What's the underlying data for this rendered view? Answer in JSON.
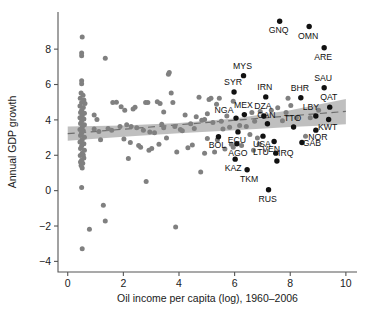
{
  "chart_data": {
    "type": "scatter",
    "title": "",
    "xlabel": "Oil income per capita (log), 1960–2006",
    "ylabel": "Annual GDP growth",
    "xlim": [
      -0.35,
      10.4
    ],
    "ylim": [
      -4.6,
      10.1
    ],
    "xticks": [
      0,
      2,
      4,
      6,
      8,
      10
    ],
    "xticklabels": [
      "0",
      "2",
      "4",
      "6",
      "8",
      "10"
    ],
    "yticks": [
      -4,
      -2,
      0,
      2,
      4,
      6,
      8
    ],
    "yticklabels": [
      "−4",
      "−2",
      "0",
      "2",
      "4",
      "6",
      "8"
    ],
    "grid": false,
    "legend": null,
    "colors": {
      "unlabeled_point": "#808080",
      "labeled_point": "#111111",
      "confidence_band": "#b4b4b4",
      "fit_line": "#6e6e6e",
      "axis": "#555555"
    },
    "fit_line": {
      "style": "dashed",
      "x_start": 0.0,
      "y_start": 3.22,
      "x_end": 10.0,
      "y_end": 4.48
    },
    "confidence_band": {
      "x": [
        0.0,
        2.0,
        4.0,
        6.0,
        8.0,
        9.2,
        10.0
      ],
      "upper": [
        3.62,
        3.68,
        3.83,
        4.08,
        4.55,
        4.92,
        5.18
      ],
      "lower": [
        2.82,
        3.04,
        3.25,
        3.42,
        3.6,
        3.68,
        3.76
      ]
    },
    "labeled_points": [
      {
        "label": "GNQ",
        "x": 7.62,
        "y": 9.58,
        "label_dx": -1,
        "label_dy": 12
      },
      {
        "label": "OMN",
        "x": 8.68,
        "y": 9.28,
        "label_dx": -1,
        "label_dy": 12
      },
      {
        "label": "ARE",
        "x": 9.22,
        "y": 8.08,
        "label_dx": -1,
        "label_dy": 12
      },
      {
        "label": "MYS",
        "x": 6.32,
        "y": 6.5,
        "label_dx": -1,
        "label_dy": -7
      },
      {
        "label": "SAU",
        "x": 9.22,
        "y": 5.82,
        "label_dx": -1,
        "label_dy": -7
      },
      {
        "label": "SYR",
        "x": 5.98,
        "y": 5.58,
        "label_dx": -1,
        "label_dy": -7
      },
      {
        "label": "IRN",
        "x": 7.12,
        "y": 5.3,
        "label_dx": -1,
        "label_dy": -7
      },
      {
        "label": "BHR",
        "x": 8.38,
        "y": 5.25,
        "label_dx": -1,
        "label_dy": -7
      },
      {
        "label": "QAT",
        "x": 9.42,
        "y": 4.72,
        "label_dx": -1,
        "label_dy": -7
      },
      {
        "label": "MEX",
        "x": 6.35,
        "y": 4.3,
        "label_dx": -1,
        "label_dy": -7
      },
      {
        "label": "NGA",
        "x": 6.05,
        "y": 4.1,
        "label_dx": -12,
        "label_dy": -5
      },
      {
        "label": "DZA",
        "x": 7.05,
        "y": 4.22,
        "label_dx": -1,
        "label_dy": -7
      },
      {
        "label": "LBY",
        "x": 8.92,
        "y": 4.22,
        "label_dx": -5,
        "label_dy": -6
      },
      {
        "label": "CAN",
        "x": 7.18,
        "y": 3.78,
        "label_dx": -1,
        "label_dy": -6
      },
      {
        "label": "KWT",
        "x": 9.38,
        "y": 4.02,
        "label_dx": -1,
        "label_dy": 10
      },
      {
        "label": "TTO",
        "x": 8.12,
        "y": 3.6,
        "label_dx": -1,
        "label_dy": -6
      },
      {
        "label": "NOR",
        "x": 8.92,
        "y": 3.42,
        "label_dx": 2,
        "label_dy": 10
      },
      {
        "label": "ECU",
        "x": 6.12,
        "y": 3.32,
        "label_dx": -1,
        "label_dy": 11
      },
      {
        "label": "USA",
        "x": 7.02,
        "y": 3.08,
        "label_dx": -1,
        "label_dy": 11
      },
      {
        "label": "BOL",
        "x": 5.42,
        "y": 3.05,
        "label_dx": -1,
        "label_dy": 11
      },
      {
        "label": "VEN",
        "x": 7.42,
        "y": 2.78,
        "label_dx": -3,
        "label_dy": 11
      },
      {
        "label": "GAB",
        "x": 8.42,
        "y": 2.72,
        "label_dx": 10,
        "label_dy": 3
      },
      {
        "label": "AGO",
        "x": 6.08,
        "y": 2.65,
        "label_dx": 1,
        "label_dy": 12
      },
      {
        "label": "IRQ",
        "x": 7.48,
        "y": 2.12,
        "label_dx": 10,
        "label_dy": 3
      },
      {
        "label": "KAZ",
        "x": 6.02,
        "y": 1.78,
        "label_dx": -2,
        "label_dy": 12
      },
      {
        "label": "TKM",
        "x": 6.45,
        "y": 1.18,
        "label_dx": 2,
        "label_dy": 12
      },
      {
        "label": "LTU",
        "x": 7.52,
        "y": 1.68,
        "label_dx": -16,
        "label_dy": -6
      },
      {
        "label": "RUS",
        "x": 7.22,
        "y": 0.05,
        "label_dx": -1,
        "label_dy": 12
      }
    ],
    "unlabeled_points": [
      {
        "x": 0.52,
        "y": 8.68
      },
      {
        "x": 0.5,
        "y": 7.78
      },
      {
        "x": 0.5,
        "y": 7.62
      },
      {
        "x": 1.35,
        "y": 7.48
      },
      {
        "x": 0.5,
        "y": 6.22
      },
      {
        "x": 0.48,
        "y": 5.52
      },
      {
        "x": 0.55,
        "y": 5.4
      },
      {
        "x": 0.45,
        "y": 5.22
      },
      {
        "x": 0.58,
        "y": 5.12
      },
      {
        "x": 0.5,
        "y": 4.98
      },
      {
        "x": 0.62,
        "y": 4.92
      },
      {
        "x": 0.44,
        "y": 4.78
      },
      {
        "x": 0.56,
        "y": 4.7
      },
      {
        "x": 0.5,
        "y": 4.55
      },
      {
        "x": 0.46,
        "y": 4.42
      },
      {
        "x": 0.6,
        "y": 4.38
      },
      {
        "x": 0.52,
        "y": 4.25
      },
      {
        "x": 0.44,
        "y": 4.12
      },
      {
        "x": 0.58,
        "y": 4.05
      },
      {
        "x": 0.5,
        "y": 3.92
      },
      {
        "x": 0.46,
        "y": 3.8
      },
      {
        "x": 0.6,
        "y": 3.72
      },
      {
        "x": 0.52,
        "y": 3.58
      },
      {
        "x": 0.44,
        "y": 3.45
      },
      {
        "x": 0.56,
        "y": 3.38
      },
      {
        "x": 0.5,
        "y": 3.25
      },
      {
        "x": 0.46,
        "y": 3.12
      },
      {
        "x": 0.6,
        "y": 3.02
      },
      {
        "x": 0.52,
        "y": 2.88
      },
      {
        "x": 0.44,
        "y": 2.75
      },
      {
        "x": 0.58,
        "y": 2.65
      },
      {
        "x": 0.5,
        "y": 2.52
      },
      {
        "x": 0.46,
        "y": 2.38
      },
      {
        "x": 0.6,
        "y": 2.28
      },
      {
        "x": 0.52,
        "y": 2.12
      },
      {
        "x": 0.45,
        "y": 1.98
      },
      {
        "x": 0.58,
        "y": 1.85
      },
      {
        "x": 0.5,
        "y": 1.72
      },
      {
        "x": 0.54,
        "y": 1.55
      },
      {
        "x": 0.48,
        "y": 1.42
      },
      {
        "x": 0.52,
        "y": 1.28
      },
      {
        "x": 0.5,
        "y": 0.18
      },
      {
        "x": 0.78,
        "y": -2.18
      },
      {
        "x": 0.52,
        "y": -3.28
      },
      {
        "x": 1.28,
        "y": -0.82
      },
      {
        "x": 1.35,
        "y": -1.72
      },
      {
        "x": 3.88,
        "y": -2.05
      },
      {
        "x": 2.82,
        "y": 0.52
      },
      {
        "x": 4.78,
        "y": 1.05
      },
      {
        "x": 1.62,
        "y": 4.98
      },
      {
        "x": 0.95,
        "y": 4.28
      },
      {
        "x": 1.05,
        "y": 4.02
      },
      {
        "x": 1.18,
        "y": 2.88
      },
      {
        "x": 1.75,
        "y": 5.0
      },
      {
        "x": 2.05,
        "y": 4.55
      },
      {
        "x": 2.12,
        "y": 3.72
      },
      {
        "x": 2.28,
        "y": 3.62
      },
      {
        "x": 2.35,
        "y": 4.62
      },
      {
        "x": 2.42,
        "y": 4.72
      },
      {
        "x": 2.48,
        "y": 3.55
      },
      {
        "x": 2.55,
        "y": 2.55
      },
      {
        "x": 2.62,
        "y": 2.45
      },
      {
        "x": 2.72,
        "y": 3.42
      },
      {
        "x": 2.8,
        "y": 4.98
      },
      {
        "x": 2.88,
        "y": 4.98
      },
      {
        "x": 2.95,
        "y": 3.32
      },
      {
        "x": 3.02,
        "y": 2.38
      },
      {
        "x": 3.12,
        "y": 3.28
      },
      {
        "x": 3.22,
        "y": 5.02
      },
      {
        "x": 3.32,
        "y": 4.92
      },
      {
        "x": 3.38,
        "y": 3.75
      },
      {
        "x": 3.45,
        "y": 3.55
      },
      {
        "x": 3.55,
        "y": 2.98
      },
      {
        "x": 3.62,
        "y": 6.58
      },
      {
        "x": 3.65,
        "y": 6.68
      },
      {
        "x": 3.72,
        "y": 5.52
      },
      {
        "x": 3.78,
        "y": 4.98
      },
      {
        "x": 3.85,
        "y": 3.62
      },
      {
        "x": 3.92,
        "y": 2.18
      },
      {
        "x": 4.05,
        "y": 3.45
      },
      {
        "x": 4.12,
        "y": 3.38
      },
      {
        "x": 4.22,
        "y": 4.28
      },
      {
        "x": 4.32,
        "y": 2.42
      },
      {
        "x": 4.42,
        "y": 3.78
      },
      {
        "x": 4.55,
        "y": 3.52
      },
      {
        "x": 4.62,
        "y": 4.18
      },
      {
        "x": 4.72,
        "y": 5.28
      },
      {
        "x": 4.82,
        "y": 3.98
      },
      {
        "x": 4.92,
        "y": 2.12
      },
      {
        "x": 5.02,
        "y": 4.35
      },
      {
        "x": 5.08,
        "y": 5.15
      },
      {
        "x": 5.15,
        "y": 5.22
      },
      {
        "x": 5.22,
        "y": 3.85
      },
      {
        "x": 5.28,
        "y": 2.18
      },
      {
        "x": 5.35,
        "y": 4.88
      },
      {
        "x": 5.45,
        "y": 5.22
      },
      {
        "x": 5.52,
        "y": 3.92
      },
      {
        "x": 5.58,
        "y": 3.48
      },
      {
        "x": 5.65,
        "y": 2.35
      },
      {
        "x": 5.72,
        "y": 4.22
      },
      {
        "x": 5.82,
        "y": 3.58
      },
      {
        "x": 5.88,
        "y": 2.62
      },
      {
        "x": 5.95,
        "y": 2.45
      },
      {
        "x": 6.18,
        "y": 3.68
      },
      {
        "x": 6.25,
        "y": 2.55
      },
      {
        "x": 6.42,
        "y": 3.62
      },
      {
        "x": 6.55,
        "y": 3.18
      },
      {
        "x": 6.62,
        "y": 4.42
      },
      {
        "x": 6.72,
        "y": 3.92
      },
      {
        "x": 6.82,
        "y": 2.98
      },
      {
        "x": 6.92,
        "y": 4.48
      },
      {
        "x": 7.32,
        "y": 4.55
      },
      {
        "x": 7.55,
        "y": 4.68
      },
      {
        "x": 7.72,
        "y": 3.95
      },
      {
        "x": 7.85,
        "y": 4.42
      },
      {
        "x": 8.02,
        "y": 4.82
      },
      {
        "x": 8.22,
        "y": 4.12
      },
      {
        "x": 8.55,
        "y": 3.08
      },
      {
        "x": 8.72,
        "y": 4.12
      },
      {
        "x": 9.02,
        "y": 4.55
      },
      {
        "x": 1.88,
        "y": 3.62
      },
      {
        "x": 2.18,
        "y": 1.82
      },
      {
        "x": 1.45,
        "y": 3.52
      },
      {
        "x": 1.58,
        "y": 3.42
      },
      {
        "x": 0.95,
        "y": 3.48
      },
      {
        "x": 1.12,
        "y": 3.35
      },
      {
        "x": 2.02,
        "y": 2.92
      },
      {
        "x": 2.25,
        "y": 2.72
      },
      {
        "x": 4.48,
        "y": 2.58
      },
      {
        "x": 5.02,
        "y": 2.95
      },
      {
        "x": 3.28,
        "y": 2.62
      },
      {
        "x": 4.92,
        "y": 4.02
      },
      {
        "x": 6.68,
        "y": 2.28
      },
      {
        "x": 5.95,
        "y": 5.05
      },
      {
        "x": 7.92,
        "y": 5.22
      },
      {
        "x": 0.5,
        "y": 6.05
      },
      {
        "x": 0.56,
        "y": 2.02
      },
      {
        "x": 0.46,
        "y": 1.62
      },
      {
        "x": 3.45,
        "y": 4.45
      },
      {
        "x": 2.92,
        "y": 2.28
      },
      {
        "x": 1.92,
        "y": 4.75
      },
      {
        "x": 6.88,
        "y": 2.62
      },
      {
        "x": 5.38,
        "y": 2.88
      }
    ]
  }
}
